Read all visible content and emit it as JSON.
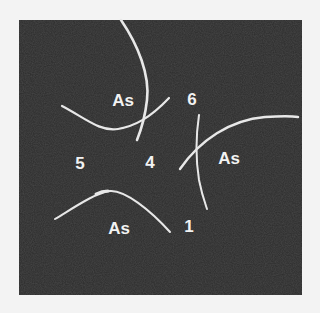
{
  "figure": {
    "background_color": "#f3f3f3",
    "panel_color": "#2b2b2b",
    "line_color": "#e8e8e8",
    "labels": [
      {
        "id": "as-top",
        "text": "As",
        "x": 123,
        "y": 100
      },
      {
        "id": "six",
        "text": "6",
        "x": 192,
        "y": 99
      },
      {
        "id": "five",
        "text": "5",
        "x": 80,
        "y": 163
      },
      {
        "id": "four",
        "text": "4",
        "x": 150,
        "y": 162
      },
      {
        "id": "as-right",
        "text": "As",
        "x": 229,
        "y": 158
      },
      {
        "id": "as-bottom",
        "text": "As",
        "x": 119,
        "y": 228
      },
      {
        "id": "one",
        "text": "1",
        "x": 189,
        "y": 226
      }
    ]
  }
}
